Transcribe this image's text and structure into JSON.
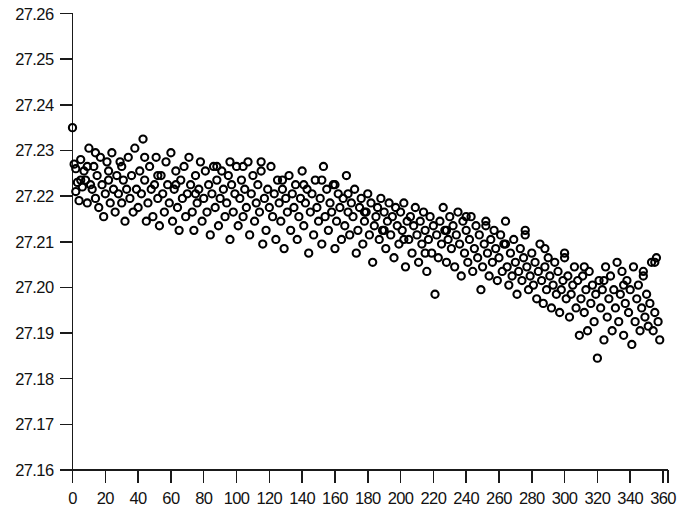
{
  "chart_data": {
    "type": "scatter",
    "title": "",
    "subtitle": "",
    "xlabel": "",
    "ylabel": "",
    "xlim": [
      0,
      360
    ],
    "ylim": [
      27.16,
      27.26
    ],
    "grid": false,
    "legend": null,
    "marker": {
      "shape": "open-circle",
      "radius_px": 3.6,
      "stroke": "#000000",
      "fill": "none",
      "stroke_width_px": 2.1
    },
    "x_ticks": [
      0,
      20,
      40,
      60,
      80,
      100,
      120,
      140,
      160,
      180,
      200,
      220,
      240,
      260,
      280,
      300,
      320,
      340,
      360
    ],
    "x_tick_labels": [
      "0",
      "20",
      "40",
      "60",
      "80",
      "100",
      "120",
      "140",
      "160",
      "180",
      "200",
      "220",
      "240",
      "260",
      "280",
      "300",
      "320",
      "340",
      "360"
    ],
    "y_ticks": [
      27.16,
      27.17,
      27.18,
      27.19,
      27.2,
      27.21,
      27.22,
      27.23,
      27.24,
      27.25,
      27.26
    ],
    "y_tick_labels": [
      "27.16",
      "27.17",
      "27.18",
      "27.19",
      "27.20",
      "27.21",
      "27.22",
      "27.23",
      "27.24",
      "27.25",
      "27.26"
    ],
    "n_points": 372,
    "trend": "decreasing",
    "trend_note": "Approximately linear decline from about 27.225 at x=0 to about 27.198 at x=360, with scatter of roughly +/- 0.008",
    "points": [
      [
        0,
        27.235
      ],
      [
        1,
        27.227
      ],
      [
        2,
        27.226
      ],
      [
        2,
        27.221
      ],
      [
        3,
        27.223
      ],
      [
        4,
        27.219
      ],
      [
        5,
        27.228
      ],
      [
        6,
        27.222
      ],
      [
        7,
        27.2255
      ],
      [
        8,
        27.2235
      ],
      [
        9,
        27.2185
      ],
      [
        10,
        27.2305
      ],
      [
        11,
        27.2225
      ],
      [
        12,
        27.2215
      ],
      [
        13,
        27.2265
      ],
      [
        14,
        27.2195
      ],
      [
        15,
        27.2245
      ],
      [
        16,
        27.2175
      ],
      [
        17,
        27.2285
      ],
      [
        18,
        27.2225
      ],
      [
        19,
        27.2155
      ],
      [
        20,
        27.2205
      ],
      [
        21,
        27.2275
      ],
      [
        22,
        27.2235
      ],
      [
        23,
        27.2185
      ],
      [
        24,
        27.2295
      ],
      [
        25,
        27.2215
      ],
      [
        26,
        27.2165
      ],
      [
        27,
        27.2245
      ],
      [
        28,
        27.2205
      ],
      [
        29,
        27.2275
      ],
      [
        30,
        27.2185
      ],
      [
        31,
        27.2235
      ],
      [
        32,
        27.2145
      ],
      [
        33,
        27.2215
      ],
      [
        34,
        27.2285
      ],
      [
        35,
        27.2195
      ],
      [
        36,
        27.2245
      ],
      [
        37,
        27.2165
      ],
      [
        38,
        27.2305
      ],
      [
        39,
        27.2215
      ],
      [
        40,
        27.2175
      ],
      [
        41,
        27.2255
      ],
      [
        42,
        27.2205
      ],
      [
        43,
        27.2325
      ],
      [
        44,
        27.2235
      ],
      [
        45,
        27.2145
      ],
      [
        46,
        27.2185
      ],
      [
        47,
        27.2265
      ],
      [
        48,
        27.2215
      ],
      [
        49,
        27.2155
      ],
      [
        50,
        27.2225
      ],
      [
        51,
        27.2285
      ],
      [
        52,
        27.2195
      ],
      [
        53,
        27.2135
      ],
      [
        54,
        27.2245
      ],
      [
        55,
        27.2205
      ],
      [
        56,
        27.2165
      ],
      [
        57,
        27.2275
      ],
      [
        58,
        27.2225
      ],
      [
        59,
        27.2185
      ],
      [
        60,
        27.2295
      ],
      [
        61,
        27.2145
      ],
      [
        62,
        27.2215
      ],
      [
        63,
        27.2255
      ],
      [
        64,
        27.2175
      ],
      [
        65,
        27.2125
      ],
      [
        66,
        27.2235
      ],
      [
        67,
        27.2195
      ],
      [
        68,
        27.2265
      ],
      [
        69,
        27.2155
      ],
      [
        70,
        27.2205
      ],
      [
        71,
        27.2285
      ],
      [
        72,
        27.2225
      ],
      [
        73,
        27.2165
      ],
      [
        74,
        27.2125
      ],
      [
        75,
        27.2245
      ],
      [
        76,
        27.2185
      ],
      [
        77,
        27.2215
      ],
      [
        78,
        27.2275
      ],
      [
        79,
        27.2145
      ],
      [
        80,
        27.2195
      ],
      [
        81,
        27.2255
      ],
      [
        82,
        27.2165
      ],
      [
        83,
        27.2225
      ],
      [
        84,
        27.2115
      ],
      [
        85,
        27.2205
      ],
      [
        86,
        27.2265
      ],
      [
        87,
        27.2175
      ],
      [
        88,
        27.2235
      ],
      [
        89,
        27.2135
      ],
      [
        90,
        27.2195
      ],
      [
        91,
        27.2255
      ],
      [
        92,
        27.2215
      ],
      [
        93,
        27.2155
      ],
      [
        94,
        27.2185
      ],
      [
        95,
        27.2245
      ],
      [
        96,
        27.2105
      ],
      [
        97,
        27.2225
      ],
      [
        98,
        27.2165
      ],
      [
        99,
        27.2205
      ],
      [
        100,
        27.2265
      ],
      [
        101,
        27.2135
      ],
      [
        102,
        27.2195
      ],
      [
        103,
        27.2235
      ],
      [
        104,
        27.2155
      ],
      [
        105,
        27.2215
      ],
      [
        106,
        27.2175
      ],
      [
        107,
        27.2275
      ],
      [
        108,
        27.2115
      ],
      [
        109,
        27.2205
      ],
      [
        110,
        27.2245
      ],
      [
        111,
        27.2145
      ],
      [
        112,
        27.2185
      ],
      [
        113,
        27.2225
      ],
      [
        114,
        27.2165
      ],
      [
        115,
        27.2255
      ],
      [
        116,
        27.2095
      ],
      [
        117,
        27.2195
      ],
      [
        118,
        27.2125
      ],
      [
        119,
        27.2215
      ],
      [
        120,
        27.2175
      ],
      [
        121,
        27.2265
      ],
      [
        122,
        27.2155
      ],
      [
        123,
        27.2205
      ],
      [
        124,
        27.2105
      ],
      [
        125,
        27.2235
      ],
      [
        126,
        27.2185
      ],
      [
        127,
        27.2145
      ],
      [
        128,
        27.2215
      ],
      [
        129,
        27.2085
      ],
      [
        130,
        27.2195
      ],
      [
        131,
        27.2165
      ],
      [
        132,
        27.2245
      ],
      [
        133,
        27.2125
      ],
      [
        134,
        27.2205
      ],
      [
        135,
        27.2175
      ],
      [
        136,
        27.2225
      ],
      [
        137,
        27.2105
      ],
      [
        138,
        27.2155
      ],
      [
        139,
        27.2195
      ],
      [
        140,
        27.2255
      ],
      [
        141,
        27.2135
      ],
      [
        142,
        27.2185
      ],
      [
        143,
        27.2215
      ],
      [
        144,
        27.2075
      ],
      [
        145,
        27.2165
      ],
      [
        146,
        27.2205
      ],
      [
        147,
        27.2115
      ],
      [
        148,
        27.2235
      ],
      [
        149,
        27.2175
      ],
      [
        150,
        27.2145
      ],
      [
        151,
        27.2195
      ],
      [
        152,
        27.2095
      ],
      [
        153,
        27.2265
      ],
      [
        154,
        27.2155
      ],
      [
        155,
        27.2215
      ],
      [
        156,
        27.2125
      ],
      [
        157,
        27.2185
      ],
      [
        158,
        27.2165
      ],
      [
        159,
        27.2225
      ],
      [
        160,
        27.2085
      ],
      [
        161,
        27.2145
      ],
      [
        162,
        27.2205
      ],
      [
        163,
        27.2175
      ],
      [
        164,
        27.2105
      ],
      [
        165,
        27.2195
      ],
      [
        166,
        27.2135
      ],
      [
        167,
        27.2245
      ],
      [
        168,
        27.2165
      ],
      [
        169,
        27.2115
      ],
      [
        170,
        27.2185
      ],
      [
        171,
        27.2155
      ],
      [
        172,
        27.2215
      ],
      [
        173,
        27.2075
      ],
      [
        174,
        27.2125
      ],
      [
        175,
        27.2175
      ],
      [
        176,
        27.2195
      ],
      [
        177,
        27.2095
      ],
      [
        178,
        27.2145
      ],
      [
        179,
        27.2165
      ],
      [
        180,
        27.2205
      ],
      [
        181,
        27.2115
      ],
      [
        182,
        27.2185
      ],
      [
        183,
        27.2055
      ],
      [
        184,
        27.2135
      ],
      [
        185,
        27.2155
      ],
      [
        186,
        27.2175
      ],
      [
        187,
        27.2105
      ],
      [
        188,
        27.2195
      ],
      [
        189,
        27.2125
      ],
      [
        190,
        27.2165
      ],
      [
        191,
        27.2085
      ],
      [
        192,
        27.2145
      ],
      [
        193,
        27.2185
      ],
      [
        194,
        27.2115
      ],
      [
        195,
        27.2155
      ],
      [
        196,
        27.2065
      ],
      [
        197,
        27.2175
      ],
      [
        198,
        27.2135
      ],
      [
        199,
        27.2095
      ],
      [
        200,
        27.2165
      ],
      [
        201,
        27.2125
      ],
      [
        202,
        27.2185
      ],
      [
        203,
        27.2045
      ],
      [
        204,
        27.2145
      ],
      [
        205,
        27.2105
      ],
      [
        206,
        27.2155
      ],
      [
        207,
        27.2075
      ],
      [
        208,
        27.2135
      ],
      [
        209,
        27.2175
      ],
      [
        210,
        27.2115
      ],
      [
        211,
        27.2055
      ],
      [
        212,
        27.2145
      ],
      [
        213,
        27.2095
      ],
      [
        214,
        27.2165
      ],
      [
        215,
        27.2125
      ],
      [
        216,
        27.2035
      ],
      [
        217,
        27.2105
      ],
      [
        218,
        27.2155
      ],
      [
        219,
        27.2075
      ],
      [
        220,
        27.2135
      ],
      [
        221,
        27.1985
      ],
      [
        222,
        27.2115
      ],
      [
        223,
        27.2065
      ],
      [
        224,
        27.2145
      ],
      [
        225,
        27.2095
      ],
      [
        226,
        27.2175
      ],
      [
        227,
        27.2125
      ],
      [
        228,
        27.2055
      ],
      [
        229,
        27.2105
      ],
      [
        230,
        27.2155
      ],
      [
        231,
        27.2085
      ],
      [
        232,
        27.2135
      ],
      [
        233,
        27.2045
      ],
      [
        234,
        27.2115
      ],
      [
        235,
        27.2165
      ],
      [
        236,
        27.2095
      ],
      [
        237,
        27.2025
      ],
      [
        238,
        27.2145
      ],
      [
        239,
        27.2075
      ],
      [
        240,
        27.2125
      ],
      [
        241,
        27.2055
      ],
      [
        242,
        27.2105
      ],
      [
        243,
        27.2155
      ],
      [
        244,
        27.2035
      ],
      [
        245,
        27.2085
      ],
      [
        246,
        27.2135
      ],
      [
        247,
        27.2065
      ],
      [
        248,
        27.2115
      ],
      [
        249,
        27.1995
      ],
      [
        250,
        27.2045
      ],
      [
        251,
        27.2095
      ],
      [
        252,
        27.2145
      ],
      [
        253,
        27.2075
      ],
      [
        254,
        27.2025
      ],
      [
        255,
        27.2105
      ],
      [
        256,
        27.2055
      ],
      [
        257,
        27.2125
      ],
      [
        258,
        27.2085
      ],
      [
        259,
        27.2015
      ],
      [
        260,
        27.2065
      ],
      [
        261,
        27.2115
      ],
      [
        262,
        27.2035
      ],
      [
        263,
        27.2095
      ],
      [
        264,
        27.2145
      ],
      [
        265,
        27.2045
      ],
      [
        266,
        27.2005
      ],
      [
        267,
        27.2075
      ],
      [
        268,
        27.2025
      ],
      [
        269,
        27.2105
      ],
      [
        270,
        27.2055
      ],
      [
        271,
        27.1985
      ],
      [
        272,
        27.2035
      ],
      [
        273,
        27.2085
      ],
      [
        274,
        27.2015
      ],
      [
        275,
        27.2065
      ],
      [
        276,
        27.2115
      ],
      [
        277,
        27.2045
      ],
      [
        278,
        27.1995
      ],
      [
        279,
        27.2025
      ],
      [
        280,
        27.2075
      ],
      [
        281,
        27.2005
      ],
      [
        282,
        27.2055
      ],
      [
        283,
        27.1975
      ],
      [
        284,
        27.2035
      ],
      [
        285,
        27.2095
      ],
      [
        286,
        27.2015
      ],
      [
        287,
        27.1965
      ],
      [
        288,
        27.2045
      ],
      [
        289,
        27.1995
      ],
      [
        290,
        27.2065
      ],
      [
        291,
        27.2025
      ],
      [
        292,
        27.1955
      ],
      [
        293,
        27.2005
      ],
      [
        294,
        27.2055
      ],
      [
        295,
        27.1985
      ],
      [
        296,
        27.2035
      ],
      [
        297,
        27.1945
      ],
      [
        298,
        27.1995
      ],
      [
        299,
        27.2015
      ],
      [
        300,
        27.2065
      ],
      [
        301,
        27.1975
      ],
      [
        302,
        27.2025
      ],
      [
        303,
        27.1935
      ],
      [
        304,
        27.1985
      ],
      [
        305,
        27.2005
      ],
      [
        306,
        27.2045
      ],
      [
        307,
        27.1955
      ],
      [
        308,
        27.2015
      ],
      [
        309,
        27.1895
      ],
      [
        310,
        27.1975
      ],
      [
        311,
        27.2025
      ],
      [
        312,
        27.1945
      ],
      [
        313,
        27.1995
      ],
      [
        314,
        27.1905
      ],
      [
        315,
        27.2035
      ],
      [
        316,
        27.1965
      ],
      [
        317,
        27.2005
      ],
      [
        318,
        27.1925
      ],
      [
        319,
        27.1985
      ],
      [
        320,
        27.1845
      ],
      [
        321,
        27.2015
      ],
      [
        322,
        27.1955
      ],
      [
        323,
        27.1995
      ],
      [
        324,
        27.1885
      ],
      [
        325,
        27.2045
      ],
      [
        326,
        27.1935
      ],
      [
        327,
        27.1975
      ],
      [
        328,
        27.2025
      ],
      [
        329,
        27.1905
      ],
      [
        330,
        27.1995
      ],
      [
        331,
        27.1955
      ],
      [
        332,
        27.2055
      ],
      [
        333,
        27.1925
      ],
      [
        334,
        27.1985
      ],
      [
        335,
        27.2035
      ],
      [
        336,
        27.1895
      ],
      [
        337,
        27.1965
      ],
      [
        338,
        27.2015
      ],
      [
        339,
        27.1945
      ],
      [
        340,
        27.1995
      ],
      [
        341,
        27.1875
      ],
      [
        342,
        27.2045
      ],
      [
        343,
        27.1925
      ],
      [
        344,
        27.1975
      ],
      [
        345,
        27.2005
      ],
      [
        346,
        27.1905
      ],
      [
        347,
        27.1955
      ],
      [
        348,
        27.2025
      ],
      [
        349,
        27.1935
      ],
      [
        350,
        27.1985
      ],
      [
        351,
        27.1915
      ],
      [
        352,
        27.1965
      ],
      [
        353,
        27.2055
      ],
      [
        354,
        27.1905
      ],
      [
        355,
        27.1945
      ],
      [
        356,
        27.2065
      ],
      [
        357,
        27.1925
      ],
      [
        358,
        27.1885
      ],
      [
        5,
        27.2235
      ],
      [
        9,
        27.2265
      ],
      [
        14,
        27.2295
      ],
      [
        22,
        27.2255
      ],
      [
        30,
        27.2265
      ],
      [
        44,
        27.2285
      ],
      [
        52,
        27.2245
      ],
      [
        63,
        27.2225
      ],
      [
        75,
        27.2205
      ],
      [
        88,
        27.2265
      ],
      [
        96,
        27.2275
      ],
      [
        104,
        27.2265
      ],
      [
        115,
        27.2275
      ],
      [
        128,
        27.2235
      ],
      [
        141,
        27.2225
      ],
      [
        152,
        27.2235
      ],
      [
        160,
        27.2225
      ],
      [
        168,
        27.2205
      ],
      [
        178,
        27.2165
      ],
      [
        190,
        27.2125
      ],
      [
        202,
        27.2105
      ],
      [
        215,
        27.2075
      ],
      [
        228,
        27.2125
      ],
      [
        240,
        27.2155
      ],
      [
        252,
        27.2135
      ],
      [
        264,
        27.2095
      ],
      [
        276,
        27.2125
      ],
      [
        288,
        27.2085
      ],
      [
        300,
        27.2075
      ],
      [
        312,
        27.2045
      ],
      [
        324,
        27.2015
      ],
      [
        336,
        27.2005
      ],
      [
        348,
        27.2035
      ],
      [
        355,
        27.2055
      ]
    ]
  },
  "axes": {
    "y_axis_name": "y-axis",
    "x_axis_name": "x-axis"
  }
}
